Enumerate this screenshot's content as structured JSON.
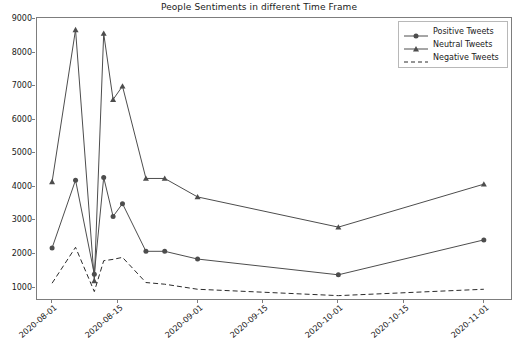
{
  "chart": {
    "title": "People Sentiments in different Time Frame",
    "xlabel": "",
    "ylabel": ""
  },
  "legend": {
    "position": "upper-right",
    "items": [
      {
        "label": "Positive Tweets",
        "marker": "circle",
        "linestyle": "solid",
        "color": "#4d4d4d"
      },
      {
        "label": "Neutral Tweets",
        "marker": "triangle",
        "linestyle": "solid",
        "color": "#4d4d4d"
      },
      {
        "label": "Negative Tweets",
        "marker": "none",
        "linestyle": "dashed",
        "color": "#2b2b2b"
      }
    ]
  },
  "axes": {
    "y_ticks": [
      "1000",
      "2000",
      "3000",
      "4000",
      "5000",
      "6000",
      "7000",
      "8000",
      "9000"
    ],
    "x_ticks": [
      "2020-08-01",
      "2020-08-15",
      "2020-09-01",
      "2020-09-15",
      "2020-10-01",
      "2020-10-15",
      "2020-11-01"
    ],
    "grid": "off"
  },
  "chart_data": {
    "type": "line",
    "title": "People Sentiments in different Time Frame",
    "xlabel": "",
    "ylabel": "",
    "xlim": [
      "2020-07-29",
      "2020-11-07"
    ],
    "ylim": [
      600,
      9000
    ],
    "grid": false,
    "legend_position": "upper right",
    "x": [
      "2020-08-01",
      "2020-08-06",
      "2020-08-10",
      "2020-08-12",
      "2020-08-14",
      "2020-08-16",
      "2020-08-21",
      "2020-08-25",
      "2020-09-01",
      "2020-10-01",
      "2020-11-01"
    ],
    "series": [
      {
        "name": "Positive Tweets",
        "marker": "circle",
        "linestyle": "solid",
        "color": "#4d4d4d",
        "values": [
          2180,
          4200,
          1400,
          4280,
          3120,
          3500,
          2080,
          2080,
          1850,
          1380,
          2420
        ]
      },
      {
        "name": "Neutral Tweets",
        "marker": "triangle",
        "linestyle": "solid",
        "color": "#4d4d4d",
        "values": [
          4150,
          8680,
          1200,
          8570,
          6600,
          7000,
          4250,
          4250,
          3700,
          2800,
          4080
        ]
      },
      {
        "name": "Negative Tweets",
        "marker": "none",
        "linestyle": "dashed",
        "color": "#2b2b2b",
        "values": [
          1130,
          2200,
          880,
          1800,
          1840,
          1900,
          1150,
          1100,
          950,
          760,
          950
        ]
      }
    ]
  }
}
